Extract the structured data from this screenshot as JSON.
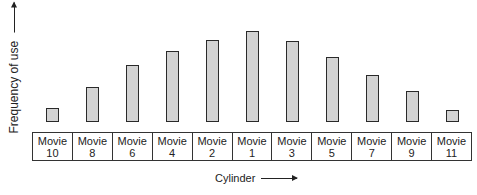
{
  "chart_data": {
    "type": "bar",
    "title": "",
    "xlabel": "Cylinder",
    "ylabel": "Frequency of use",
    "categories": [
      "Movie 10",
      "Movie 8",
      "Movie 6",
      "Movie 4",
      "Movie 2",
      "Movie 1",
      "Movie 3",
      "Movie 5",
      "Movie 7",
      "Movie 9",
      "Movie 11"
    ],
    "values": [
      14,
      35,
      57,
      71,
      82,
      91,
      81,
      65,
      47,
      31,
      12
    ],
    "bar_color": "#d3d3d3",
    "grid": false,
    "axis_ticks": false
  },
  "labels": {
    "ylabel": "Frequency of use",
    "xlabel": "Cylinder"
  },
  "cells": [
    {
      "line1": "Movie",
      "line2": "10"
    },
    {
      "line1": "Movie",
      "line2": "8"
    },
    {
      "line1": "Movie",
      "line2": "6"
    },
    {
      "line1": "Movie",
      "line2": "4"
    },
    {
      "line1": "Movie",
      "line2": "2"
    },
    {
      "line1": "Movie",
      "line2": "1"
    },
    {
      "line1": "Movie",
      "line2": "3"
    },
    {
      "line1": "Movie",
      "line2": "5"
    },
    {
      "line1": "Movie",
      "line2": "7"
    },
    {
      "line1": "Movie",
      "line2": "9"
    },
    {
      "line1": "Movie",
      "line2": "11"
    }
  ]
}
